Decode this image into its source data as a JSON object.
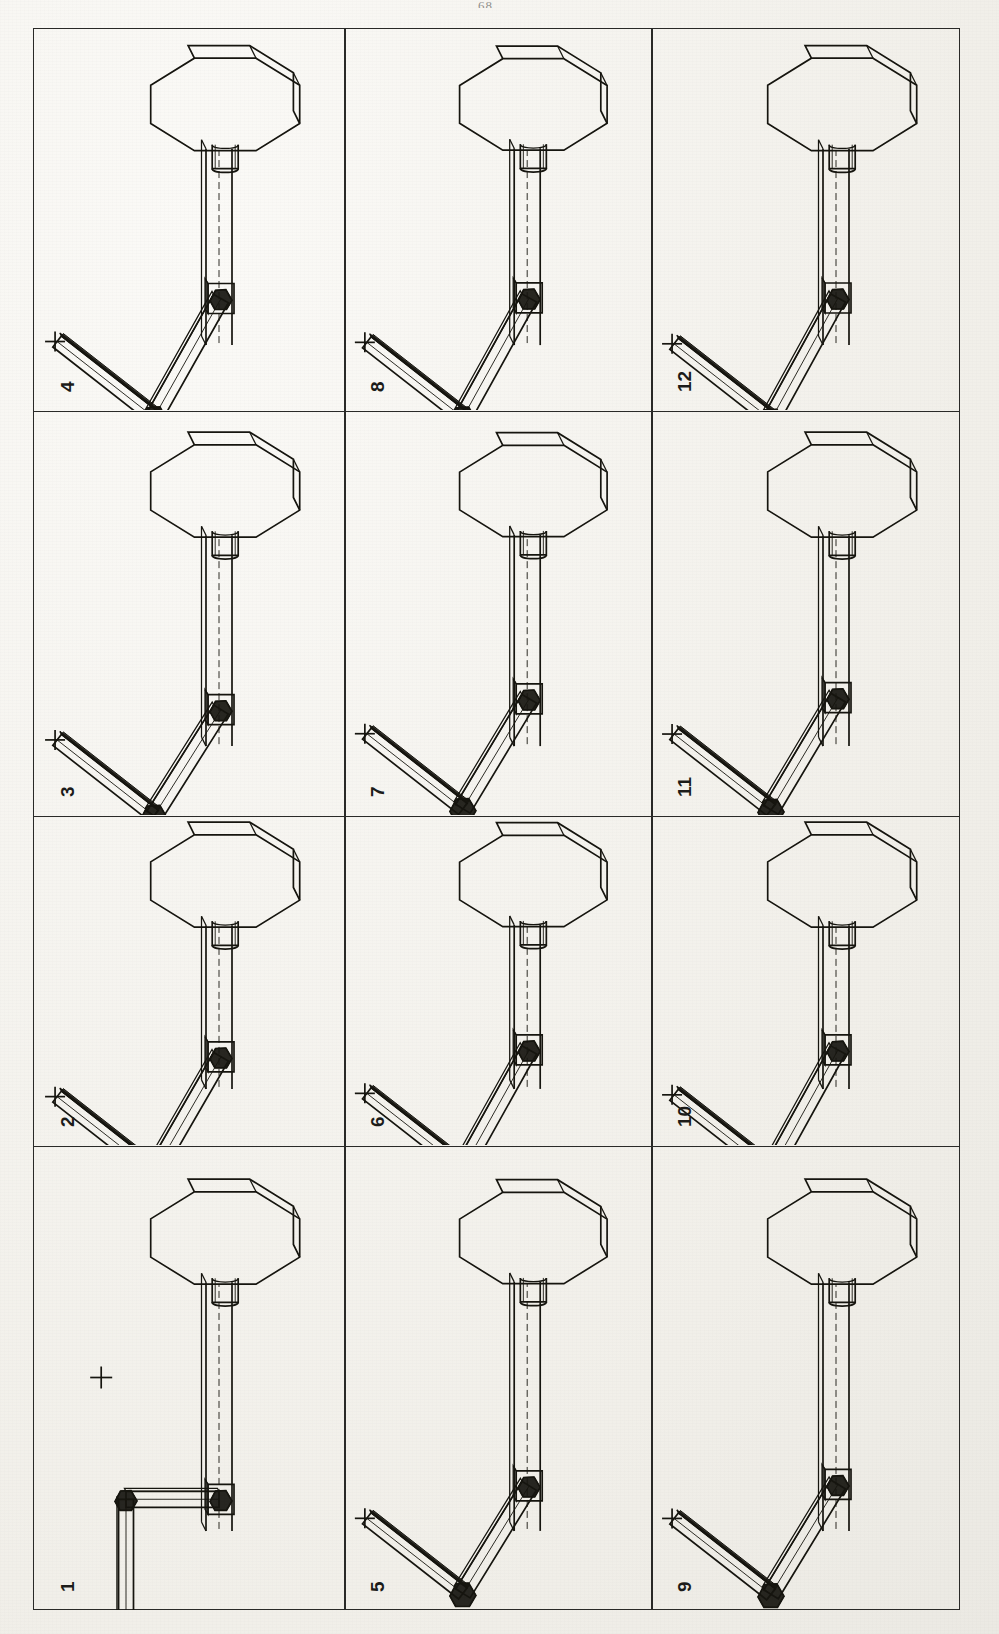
{
  "document": {
    "kind": "scanned-figure-page",
    "page_number_mark": "68",
    "orientation": "rotated-90-ccw",
    "figure_title": "",
    "background_color": "#f1efe9",
    "ink_color": "#16150f"
  },
  "grid": {
    "rows": 3,
    "cols": 4,
    "border_color": "#2a2a28",
    "column_dividers_x": [
      343,
      650
    ],
    "row_dividers_y": [
      410,
      815,
      1145
    ]
  },
  "chart_data": {
    "type": "table",
    "xlabel": "",
    "ylabel": "",
    "legend": [],
    "categories": [
      "1",
      "2",
      "3",
      "4",
      "5",
      "6",
      "7",
      "8",
      "9",
      "10",
      "11",
      "12"
    ],
    "values": [
      1,
      2,
      3,
      4,
      5,
      6,
      7,
      8,
      9,
      10,
      11,
      12
    ]
  },
  "panels": [
    {
      "id": "panel-4",
      "label": "4",
      "col": 0,
      "row": 0,
      "pose": "elbow-bent-up-reaching-target",
      "target_reached": true,
      "shoulder_deg": 118,
      "elbow_deg": 128,
      "base_slide": 0.34
    },
    {
      "id": "panel-8",
      "label": "8",
      "col": 1,
      "row": 0,
      "pose": "elbow-bent-up-reaching-target",
      "target_reached": true,
      "shoulder_deg": 122,
      "elbow_deg": 126,
      "base_slide": 0.33
    },
    {
      "id": "panel-12",
      "label": "12",
      "col": 2,
      "row": 0,
      "pose": "elbow-bent-up-reaching-target",
      "target_reached": true,
      "shoulder_deg": 124,
      "elbow_deg": 124,
      "base_slide": 0.33
    },
    {
      "id": "panel-3",
      "label": "3",
      "col": 0,
      "row": 1,
      "pose": "upper-link-vertical-mid-motion",
      "target_reached": false,
      "shoulder_deg": 96,
      "elbow_deg": 148,
      "base_slide": 0.55
    },
    {
      "id": "panel-7",
      "label": "7",
      "col": 1,
      "row": 1,
      "pose": "upper-link-near-vertical-approaching",
      "target_reached": true,
      "shoulder_deg": 104,
      "elbow_deg": 140,
      "base_slide": 0.38
    },
    {
      "id": "panel-11",
      "label": "11",
      "col": 2,
      "row": 1,
      "pose": "upper-link-near-vertical-approaching",
      "target_reached": true,
      "shoulder_deg": 106,
      "elbow_deg": 138,
      "base_slide": 0.36
    },
    {
      "id": "panel-2",
      "label": "2",
      "col": 0,
      "row": 2,
      "pose": "early-lift-elbow-folding",
      "target_reached": true,
      "shoulder_deg": 112,
      "elbow_deg": 134,
      "base_slide": 0.48
    },
    {
      "id": "panel-6",
      "label": "6",
      "col": 1,
      "row": 2,
      "pose": "elbow-bent-up-reaching-target",
      "target_reached": true,
      "shoulder_deg": 120,
      "elbow_deg": 128,
      "base_slide": 0.34
    },
    {
      "id": "panel-10",
      "label": "10",
      "col": 2,
      "row": 2,
      "pose": "elbow-bent-up-reaching-target",
      "target_reached": true,
      "shoulder_deg": 122,
      "elbow_deg": 126,
      "base_slide": 0.34
    },
    {
      "id": "panel-1",
      "label": "1",
      "col": 0,
      "row": 3,
      "pose": "home-pose-arm-folded-square",
      "target_reached": false,
      "shoulder_deg": 90,
      "elbow_deg": 90,
      "base_slide": 0.7
    },
    {
      "id": "panel-5",
      "label": "5",
      "col": 1,
      "row": 3,
      "pose": "first-lift-link-raised",
      "target_reached": false,
      "shoulder_deg": 100,
      "elbow_deg": 150,
      "base_slide": 0.52
    },
    {
      "id": "panel-9",
      "label": "9",
      "col": 2,
      "row": 3,
      "pose": "first-lift-link-raised",
      "target_reached": false,
      "shoulder_deg": 102,
      "elbow_deg": 146,
      "base_slide": 0.5
    }
  ],
  "robot": {
    "parts": [
      "octagonal-base-disc",
      "hub-cylinder",
      "horizontal-rail",
      "carriage-slider",
      "shoulder-joint",
      "lower-link",
      "elbow-joint",
      "upper-link",
      "end-effector-tip"
    ],
    "target_marker": "plus-cross"
  }
}
